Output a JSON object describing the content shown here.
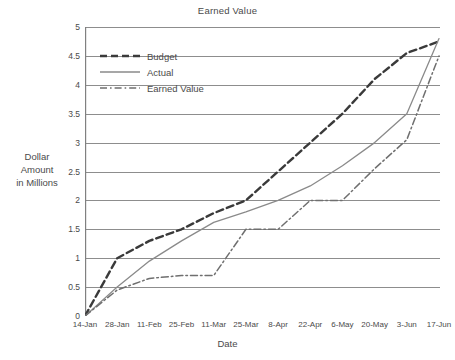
{
  "chart_data": {
    "type": "line",
    "title": "Earned Value",
    "xlabel": "Date",
    "ylabel": "Dollar Amount in Millions",
    "ylabel_lines": [
      "Dollar",
      "Amount",
      "in Millions"
    ],
    "categories": [
      "14-Jan",
      "28-Jan",
      "11-Feb",
      "25-Feb",
      "11-Mar",
      "25-Mar",
      "8-Apr",
      "22-Apr",
      "6-May",
      "20-May",
      "3-Jun",
      "17-Jun"
    ],
    "yticks": [
      "5",
      "4.5",
      "4",
      "3.5",
      "3",
      "2.5",
      "2",
      "1.5",
      "1",
      "0.5",
      "0"
    ],
    "ytick_values": [
      5,
      4.5,
      4,
      3.5,
      3,
      2.5,
      2,
      1.5,
      1,
      0.5,
      0
    ],
    "ylim": [
      0,
      5
    ],
    "grid": "horizontal",
    "legend_position": "upper-left-inside",
    "series": [
      {
        "name": "Budget",
        "style": "dashed",
        "color": "#3a3a3a",
        "values": [
          0,
          1.0,
          1.3,
          1.5,
          1.78,
          2.0,
          2.5,
          3.0,
          3.5,
          4.1,
          4.55,
          4.75
        ]
      },
      {
        "name": "Actual",
        "style": "solid",
        "color": "#8a8a8a",
        "values": [
          0,
          0.5,
          0.95,
          1.3,
          1.62,
          1.8,
          2.0,
          2.25,
          2.6,
          3.0,
          3.5,
          4.8
        ]
      },
      {
        "name": "Earned Value",
        "style": "dashdot",
        "color": "#6f6f6f",
        "values": [
          0,
          0.45,
          0.65,
          0.7,
          0.7,
          1.5,
          1.5,
          2.0,
          2.0,
          2.55,
          3.05,
          4.5
        ]
      }
    ],
    "grid_color": "#808080",
    "axis_color": "#808080"
  }
}
